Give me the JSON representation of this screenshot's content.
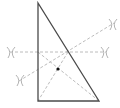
{
  "diagram": {
    "colors": {
      "triangle_edge": "#4a4a4a",
      "construction_line": "#b4b4b4",
      "arc_mark": "#a0a0a0",
      "point": "#111111",
      "background": "#ffffff"
    },
    "triangle": {
      "vertices": [
        {
          "name": "apex",
          "x": 38,
          "y": 3
        },
        {
          "name": "bottom-left",
          "x": 38,
          "y": 101
        },
        {
          "name": "bottom-right",
          "x": 99,
          "y": 101
        }
      ]
    },
    "construction_lines": [
      {
        "name": "perpendicular-bisector-vertical-leg",
        "x1": 10,
        "y1": 52,
        "x2": 106,
        "y2": 52
      },
      {
        "name": "perpendicular-bisector-hypotenuse",
        "x1": 19,
        "y1": 81,
        "x2": 114,
        "y2": 23
      },
      {
        "name": "median-to-hypotenuse",
        "x1": 68,
        "y1": 52,
        "x2": 38,
        "y2": 101
      },
      {
        "name": "median-to-vertical-leg",
        "x1": 38,
        "y1": 52,
        "x2": 99,
        "y2": 101
      }
    ],
    "arc_marks": [
      {
        "name": "arc-left-horizontal",
        "x": 11,
        "y": 52
      },
      {
        "name": "arc-right-horizontal",
        "x": 105,
        "y": 52
      },
      {
        "name": "arc-lower-left-diagonal",
        "x": 20,
        "y": 80
      },
      {
        "name": "arc-upper-right-diagonal",
        "x": 113,
        "y": 24
      }
    ],
    "point": {
      "name": "centroid",
      "x": 58,
      "y": 69,
      "r": 1.6
    }
  }
}
